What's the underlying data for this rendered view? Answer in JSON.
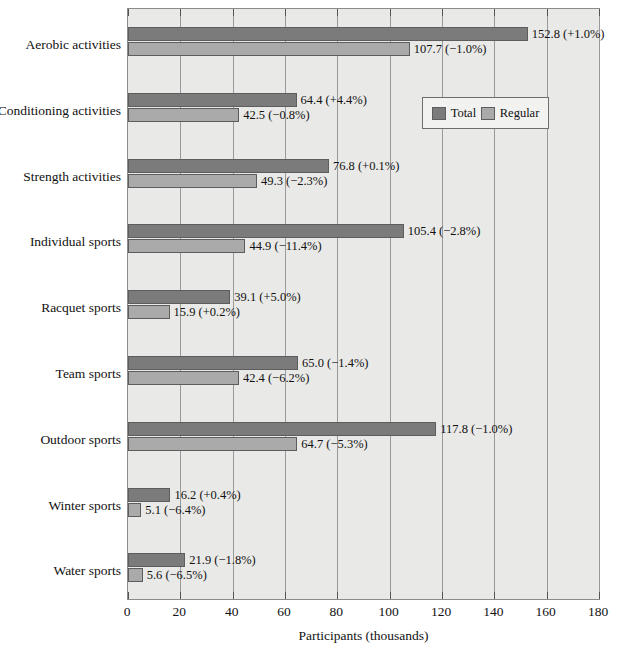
{
  "chart_data": {
    "type": "bar",
    "orientation": "horizontal",
    "title": "",
    "xlabel": "Participants (thousands)",
    "ylabel": "",
    "xlim": [
      0,
      180
    ],
    "xticks": [
      0,
      20,
      40,
      60,
      80,
      100,
      120,
      140,
      160,
      180
    ],
    "xtick_labels": [
      "0",
      "20",
      "40",
      "60",
      "80",
      "100",
      "120",
      "140",
      "160",
      "180"
    ],
    "grid": true,
    "legend_position": "upper right inside",
    "categories": [
      "Aerobic activities",
      "Conditioning activities",
      "Strength activities",
      "Individual sports",
      "Racquet sports",
      "Team sports",
      "Outdoor sports",
      "Winter sports",
      "Water sports"
    ],
    "series": [
      {
        "name": "Total",
        "color": "#7b7b7b",
        "values": [
          152.8,
          64.4,
          76.8,
          105.4,
          39.1,
          65.0,
          117.8,
          16.2,
          21.9
        ],
        "labels": [
          "152.8 (+1.0%)",
          "64.4 (+4.4%)",
          "76.8 (+0.1%)",
          "105.4 (−2.8%)",
          "39.1 (+5.0%)",
          "65.0 (−1.4%)",
          "117.8 (−1.0%)",
          "16.2 (+0.4%)",
          "21.9 (−1.8%)"
        ]
      },
      {
        "name": "Regular",
        "color": "#aaaaaa",
        "values": [
          107.7,
          42.5,
          49.3,
          44.9,
          15.9,
          42.4,
          64.7,
          5.1,
          5.6
        ],
        "labels": [
          "107.7 (−1.0%)",
          "42.5 (−0.8%)",
          "49.3 (−2.3%)",
          "44.9 (−11.4%)",
          "15.9 (+0.2%)",
          "42.4 (−6.2%)",
          "64.7 (−5.3%)",
          "5.1 (−6.4%)",
          "5.6 (−6.5%)"
        ]
      }
    ]
  },
  "legend": {
    "items": [
      {
        "label": "Total",
        "swatch": "total"
      },
      {
        "label": "Regular",
        "swatch": "regular"
      }
    ]
  },
  "axis": {
    "x_title": "Participants (thousands)"
  },
  "caption": {
    "text": ""
  }
}
